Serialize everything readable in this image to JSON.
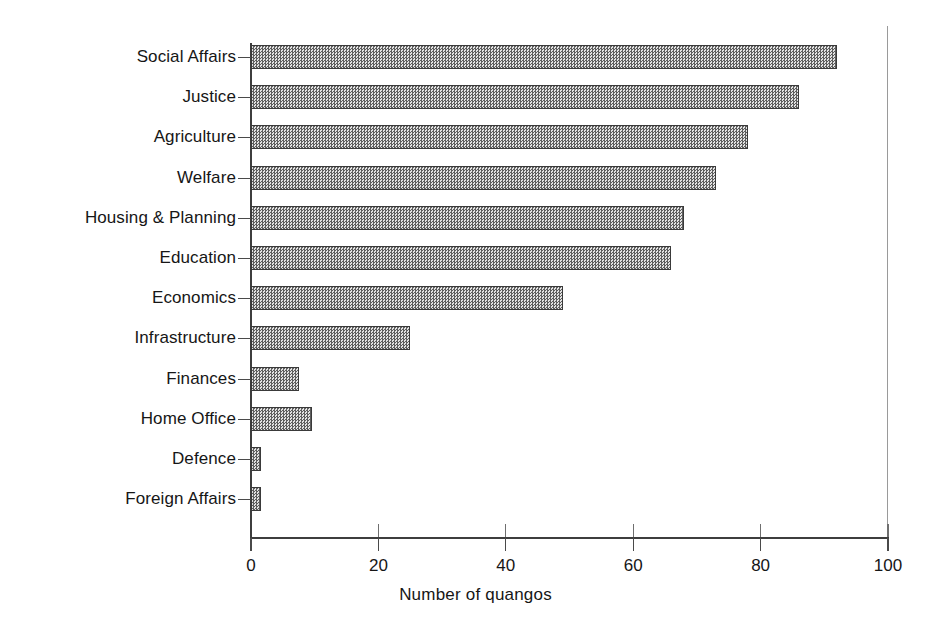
{
  "chart_data": {
    "type": "bar",
    "orientation": "horizontal",
    "title": "",
    "xlabel": "Number of quangos",
    "ylabel": "",
    "xlim": [
      0,
      100
    ],
    "xticks": [
      0,
      20,
      40,
      60,
      80,
      100
    ],
    "xtick_labels": [
      "0",
      "20",
      "40",
      "60",
      "80",
      "100"
    ],
    "grid": false,
    "legend": null,
    "bar_fill": "#8a8a8a",
    "bar_edge": "#3a3a3a",
    "categories": [
      "Social Affairs",
      "Justice",
      "Agriculture",
      "Welfare",
      "Housing & Planning",
      "Education",
      "Economics",
      "Infrastructure",
      "Finances",
      "Home Office",
      "Defence",
      "Foreign Affairs"
    ],
    "values": [
      92,
      86,
      78,
      73,
      68,
      66,
      49,
      25,
      7.5,
      9.5,
      1.5,
      1.5
    ]
  }
}
